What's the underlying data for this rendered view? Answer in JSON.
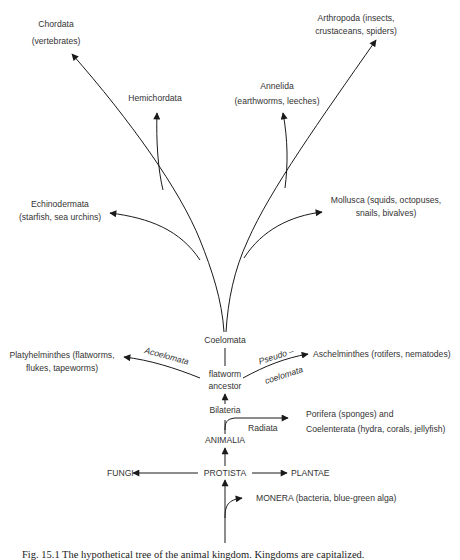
{
  "diagram": {
    "type": "phylogenetic-tree",
    "caption": "Fig. 15.1  The hypothetical tree of the animal kingdom. Kingdoms are capitalized."
  },
  "nodes": {
    "chordata": {
      "name": "Chordata",
      "examples": "(vertebrates)"
    },
    "hemichordata": {
      "name": "Hemichordata"
    },
    "annelida": {
      "name": "Annelida",
      "examples": "(earthworms, leeches)"
    },
    "arthropoda": {
      "line1": "Arthropoda  (insects,",
      "line2": "crustaceans, spiders)"
    },
    "echinodermata": {
      "name": "Echinodermata",
      "examples": "(starfish, sea urchins)"
    },
    "mollusca": {
      "line1": "Mollusca  (squids, octopuses,",
      "line2": "snails, bivalves)"
    },
    "coelomata": {
      "name": "Coelomata"
    },
    "platyhelminthes": {
      "line1": "Platyhelminthes  (flatworms,",
      "line2": "flukes, tapeworms)"
    },
    "acoelomata": {
      "name": "Acoelomata"
    },
    "flatworm_ancestor": {
      "line1": "flatworm",
      "line2": "ancestor"
    },
    "pseudocoelomata": {
      "line1": "Pseudo –",
      "line2": "coelomata"
    },
    "aschelminthes": {
      "name": "Aschelminthes (rotifers, nematodes)"
    },
    "bilateria": {
      "name": "Bilateria"
    },
    "radiata": {
      "name": "Radiata"
    },
    "porifera": {
      "line1": "Porifera (sponges) and",
      "line2": "Coelenterata  (hydra, corals, jellyfish)"
    },
    "animalia": {
      "name": "ANIMALIA"
    },
    "fungi": {
      "name": "FUNGI"
    },
    "protista": {
      "name": "PROTISTA"
    },
    "plantae": {
      "name": "PLANTAE"
    },
    "monera": {
      "name": "MONERA  (bacteria, blue-green  alga)"
    }
  },
  "colors": {
    "line": "#1a1a1a",
    "text": "#333333",
    "background": "#ffffff"
  }
}
